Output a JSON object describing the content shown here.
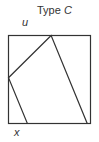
{
  "title": {
    "prefix": "Type",
    "variable": "C"
  },
  "labels": {
    "top": "u",
    "bottom": "x"
  },
  "diagram": {
    "square_side": 1,
    "quad_vertices_fraction": [
      {
        "edge": "top",
        "t": 0.52
      },
      {
        "edge": "left",
        "t": 0.48
      },
      {
        "edge": "bottom",
        "t": 0.23
      },
      {
        "edge": "bottom",
        "t": 0.96
      }
    ]
  }
}
